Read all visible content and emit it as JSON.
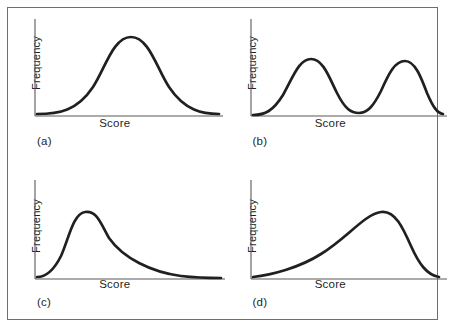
{
  "figure": {
    "panels": [
      {
        "id": "a",
        "label": "(a)",
        "x_axis_title": "Score",
        "y_axis_title": "Frequency",
        "shape_name": "symmetric-normal",
        "curve_path": "M 6 99 C 28 99, 46 96, 62 72 C 74 54, 82 22, 100 22 C 118 22, 126 54, 138 72 C 154 96, 172 99, 188 99"
      },
      {
        "id": "b",
        "label": "(b)",
        "x_axis_title": "Score",
        "y_axis_title": "Frequency",
        "shape_name": "bimodal",
        "curve_path": "M 6 100 C 18 100, 26 96, 36 80 C 46 62, 52 44, 64 44 C 76 44, 82 62, 90 78 C 98 94, 104 98, 112 98 C 120 98, 126 92, 134 76 C 142 58, 148 46, 158 46 C 168 46, 174 62, 180 78 C 186 92, 190 98, 196 99"
      },
      {
        "id": "c",
        "label": "(c)",
        "x_axis_title": "Score",
        "y_axis_title": "Frequency",
        "shape_name": "positively-skewed",
        "curve_path": "M 6 101 C 14 101, 22 96, 30 80 C 38 62, 42 38, 54 36 C 66 34, 70 48, 78 62 C 92 82, 120 96, 150 100 C 168 102, 180 102, 190 102"
      },
      {
        "id": "d",
        "label": "(d)",
        "x_axis_title": "Score",
        "y_axis_title": "Frequency",
        "shape_name": "negatively-skewed",
        "curve_path": "M 6 101 C 24 99, 52 92, 74 78 C 100 62, 118 38, 134 36 C 148 34, 156 52, 164 70 C 172 88, 180 99, 192 101"
      }
    ],
    "colors": {
      "curve": "#231f20",
      "axis": "#58585b",
      "frame": "#6e6e70",
      "background": "#ffffff"
    }
  }
}
